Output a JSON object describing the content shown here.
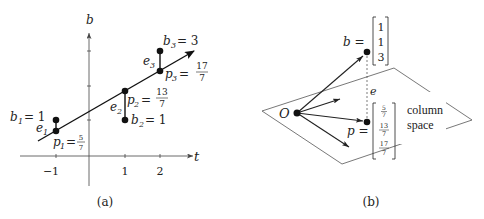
{
  "panel_a": {
    "caption": "(a)",
    "axes": {
      "x_label": "t",
      "y_label": "b"
    },
    "x_ticks": [
      "−1",
      "1",
      "2"
    ],
    "points": {
      "b1": {
        "name": "b",
        "sub": "1",
        "eq": "= 1"
      },
      "b2": {
        "name": "b",
        "sub": "2",
        "eq": "= 1"
      },
      "b3": {
        "name": "b",
        "sub": "3",
        "eq": "= 3"
      },
      "p1": {
        "name": "p",
        "sub": "1",
        "eq": "=",
        "num": "5",
        "den": "7"
      },
      "p2": {
        "name": "p",
        "sub": "2",
        "eq": "=",
        "num": "13",
        "den": "7"
      },
      "p3": {
        "name": "p",
        "sub": "3",
        "eq": "=",
        "num": "17",
        "den": "7"
      }
    },
    "errors": [
      {
        "name": "e",
        "sub": "1"
      },
      {
        "name": "e",
        "sub": "2"
      },
      {
        "name": "e",
        "sub": "3"
      }
    ]
  },
  "panel_b": {
    "caption": "(b)",
    "origin_label": "O",
    "b_vector": {
      "label": "b =",
      "entries": [
        "1",
        "1",
        "3"
      ]
    },
    "p_vector": {
      "label": "p =",
      "entries": [
        {
          "num": "5",
          "den": "7"
        },
        {
          "num": "13",
          "den": "7"
        },
        {
          "num": "17",
          "den": "7"
        }
      ]
    },
    "error_label": "e",
    "plane_label": [
      "column",
      "space"
    ]
  }
}
